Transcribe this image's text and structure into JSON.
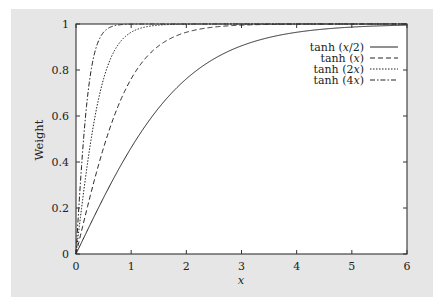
{
  "chart_data": {
    "type": "line",
    "title": "",
    "xlabel": "x",
    "ylabel": "Weight",
    "xlim": [
      0,
      6
    ],
    "ylim": [
      0,
      1
    ],
    "xticks": [
      "0",
      "1",
      "2",
      "3",
      "4",
      "5",
      "6"
    ],
    "yticks": [
      "0",
      "0.2",
      "0.4",
      "0.6",
      "0.8",
      "1"
    ],
    "grid": false,
    "legend_position": "top-right",
    "series": [
      {
        "name": "tanh (x/2)",
        "label_prefix": "tanh (",
        "label_var": "x",
        "label_suffix": "/2)",
        "k": 0.5,
        "dash": "solid",
        "x": [
          0,
          0.5,
          1,
          1.5,
          2,
          2.5,
          3,
          3.5,
          4,
          4.5,
          5,
          5.5,
          6
        ],
        "values": [
          0,
          0.245,
          0.462,
          0.635,
          0.762,
          0.848,
          0.905,
          0.941,
          0.964,
          0.978,
          0.987,
          0.992,
          0.995
        ]
      },
      {
        "name": "tanh (x)",
        "label_prefix": "tanh (",
        "label_var": "x",
        "label_suffix": ")",
        "k": 1,
        "dash": "dashed",
        "x": [
          0,
          0.5,
          1,
          1.5,
          2,
          2.5,
          3,
          4,
          5,
          6
        ],
        "values": [
          0,
          0.462,
          0.762,
          0.905,
          0.964,
          0.987,
          0.995,
          0.999,
          1.0,
          1.0
        ]
      },
      {
        "name": "tanh (2x)",
        "label_prefix": "tanh (2",
        "label_var": "x",
        "label_suffix": ")",
        "k": 2,
        "dash": "dotted",
        "x": [
          0,
          0.25,
          0.5,
          0.75,
          1,
          1.5,
          2,
          3,
          6
        ],
        "values": [
          0,
          0.462,
          0.762,
          0.905,
          0.964,
          0.995,
          0.999,
          1.0,
          1.0
        ]
      },
      {
        "name": "tanh (4x)",
        "label_prefix": "tanh (4",
        "label_var": "x",
        "label_suffix": ")",
        "k": 4,
        "dash": "dash-dot",
        "x": [
          0,
          0.125,
          0.25,
          0.375,
          0.5,
          0.75,
          1,
          2,
          6
        ],
        "values": [
          0,
          0.462,
          0.762,
          0.905,
          0.964,
          0.995,
          0.999,
          1.0,
          1.0
        ]
      }
    ]
  },
  "colors": {
    "panel_background": "#e6e6e6",
    "plot_background": "#ffffff",
    "line": "#222222"
  }
}
